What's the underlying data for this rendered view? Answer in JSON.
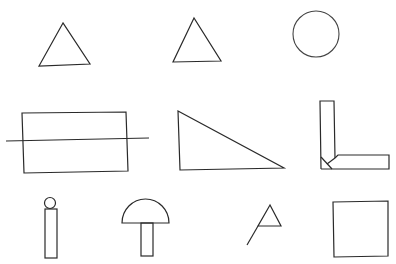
{
  "figure": {
    "width": 396,
    "height": 264,
    "background": "#ffffff",
    "stroke_color": "#2a2a2a",
    "grid": {
      "rows": 3,
      "cols_per_row": [
        3,
        3,
        4
      ]
    },
    "shapes": [
      {
        "id": "triangle-1",
        "type": "triangle",
        "row": 1,
        "points": [
          [
            63,
            23
          ],
          [
            39,
            66
          ],
          [
            90,
            64
          ]
        ]
      },
      {
        "id": "triangle-2",
        "type": "triangle",
        "row": 1,
        "points": [
          [
            194,
            18
          ],
          [
            173,
            62
          ],
          [
            221,
            61
          ]
        ]
      },
      {
        "id": "circle",
        "type": "circle",
        "row": 1,
        "cx": 316,
        "cy": 34,
        "r": 23
      },
      {
        "id": "rectangle-with-line",
        "type": "rectangle-crossed",
        "row": 2,
        "points": [
          [
            22,
            113
          ],
          [
            126,
            112
          ],
          [
            128,
            171
          ],
          [
            24,
            173
          ]
        ],
        "line": [
          [
            6,
            141
          ],
          [
            149,
            138
          ]
        ]
      },
      {
        "id": "right-triangle",
        "type": "triangle",
        "row": 2,
        "points": [
          [
            178,
            111
          ],
          [
            180,
            170
          ],
          [
            284,
            168
          ]
        ]
      },
      {
        "id": "l-shape",
        "type": "l-shape",
        "row": 2
      },
      {
        "id": "i-shape",
        "type": "circle-on-bar",
        "row": 3,
        "circle": {
          "cx": 50,
          "cy": 203,
          "r": 5.5
        },
        "bar": [
          45,
          209,
          12,
          49
        ]
      },
      {
        "id": "mushroom",
        "type": "semicircle-on-stem",
        "row": 3,
        "cap": {
          "x1": 122,
          "x2": 169,
          "y": 223,
          "r": 23.5
        },
        "stem": [
          141,
          223,
          12,
          33
        ]
      },
      {
        "id": "flag",
        "type": "triangle-with-line",
        "row": 3,
        "points": [
          [
            270,
            205
          ],
          [
            258,
            226
          ],
          [
            281,
            226
          ]
        ],
        "line": [
          [
            258,
            226
          ],
          [
            247,
            245
          ]
        ]
      },
      {
        "id": "square",
        "type": "square",
        "row": 3,
        "points": [
          [
            333,
            202
          ],
          [
            388,
            201
          ],
          [
            388,
            256
          ],
          [
            334,
            257
          ]
        ]
      }
    ]
  }
}
